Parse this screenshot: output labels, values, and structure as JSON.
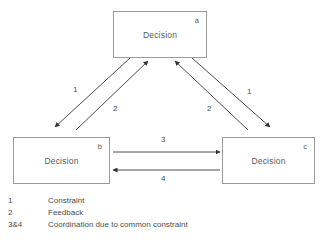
{
  "diagram": {
    "nodes": [
      {
        "id": "a",
        "label": "Decision",
        "tag": "a"
      },
      {
        "id": "b",
        "label": "Decision",
        "tag": "b"
      },
      {
        "id": "c",
        "label": "Decision",
        "tag": "c"
      }
    ],
    "edge_labels": {
      "a_to_b": "1",
      "b_to_a": "2",
      "a_to_c": "1",
      "c_to_a": "2",
      "b_to_c": "3",
      "c_to_b": "4"
    },
    "legend": [
      {
        "key": "1",
        "desc": "Constraint"
      },
      {
        "key": "2",
        "desc": "Feedback"
      },
      {
        "key": "3&4",
        "desc": "Coordination due to common constraint"
      }
    ],
    "colors": {
      "box_border": "#9a9a9a",
      "text": "#5b5b5b",
      "arrow": "#4d4d4d",
      "background": "#ffffff"
    }
  }
}
